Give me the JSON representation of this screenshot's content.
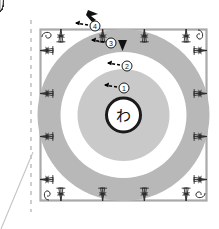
{
  "diagram": {
    "center_symbol": "わ",
    "center_symbol_name": "wa-loop-ring",
    "round_markers": [
      {
        "label": "①",
        "round": 1,
        "x": 124,
        "y": 88
      },
      {
        "label": "②",
        "round": 2,
        "x": 127,
        "y": 66
      },
      {
        "label": "③",
        "round": 3,
        "x": 111,
        "y": 43
      },
      {
        "label": "④",
        "round": 4,
        "x": 95,
        "y": 26
      }
    ],
    "colors": {
      "ring_gray": "#b8b8b8",
      "inner_gray": "#c9c9c9",
      "stitch_outline": "#2b2b2b",
      "frame_gray": "#aaaaaa",
      "background": "#ffffff",
      "marker_black": "#000000",
      "dashed_guide": "#bbbbbb"
    },
    "geometry": {
      "frame": {
        "x": 40,
        "y": 29,
        "w": 167,
        "h": 172
      },
      "center": {
        "cx": 123.5,
        "cy": 115
      },
      "radii": {
        "center_ring_outer": 17,
        "center_ring_inner": 13,
        "inner_disc": 46,
        "white_band_outer": 63,
        "gray_band_outer": 86
      },
      "spokes_round1": 14,
      "leaves_round2": 14,
      "fans_round3": 14,
      "clusters_round4": 16,
      "dashed_line_x": 31,
      "leader_line": {
        "x1": 33,
        "y1": 152,
        "x2": 2,
        "y2": 228
      }
    }
  }
}
